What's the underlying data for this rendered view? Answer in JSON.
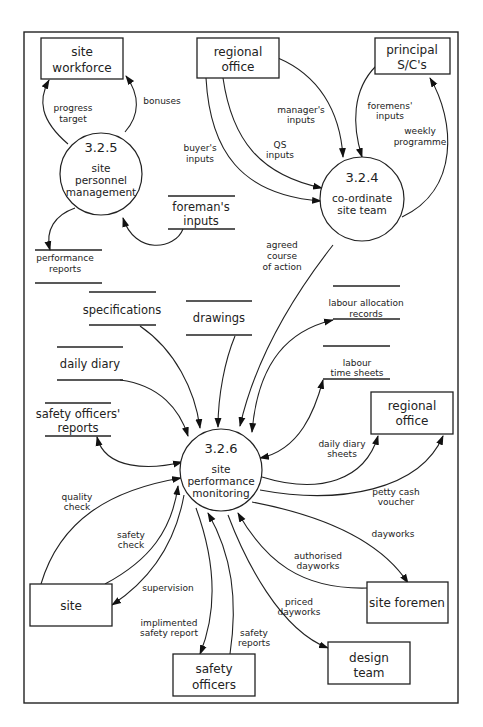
{
  "diagram": {
    "type": "data-flow-diagram",
    "processes": [
      {
        "id": "3.2.5",
        "name_lines": [
          "site",
          "personnel",
          "management"
        ]
      },
      {
        "id": "3.2.4",
        "name_lines": [
          "co-ordinate",
          "site team"
        ]
      },
      {
        "id": "3.2.6",
        "name_lines": [
          "site",
          "performance",
          "monitoring"
        ]
      }
    ],
    "entities": [
      {
        "key": "site_workforce",
        "lines": [
          "site",
          "workforce"
        ]
      },
      {
        "key": "regional_office_top",
        "lines": [
          "regional",
          "office"
        ]
      },
      {
        "key": "principal_sc",
        "lines": [
          "principal",
          "S/C's"
        ]
      },
      {
        "key": "regional_office_right",
        "lines": [
          "regional",
          "office"
        ]
      },
      {
        "key": "site",
        "lines": [
          "site"
        ]
      },
      {
        "key": "site_foremen",
        "lines": [
          "site foremen"
        ]
      },
      {
        "key": "safety_officers",
        "lines": [
          "safety",
          "officers"
        ]
      },
      {
        "key": "design_team",
        "lines": [
          "design",
          "team"
        ]
      }
    ],
    "stores": [
      {
        "key": "foremans_inputs",
        "lines": [
          "foreman's",
          "inputs"
        ]
      },
      {
        "key": "performance_reports",
        "lines": [
          "performance",
          "reports"
        ]
      },
      {
        "key": "specifications",
        "lines": [
          "specifications"
        ]
      },
      {
        "key": "drawings",
        "lines": [
          "drawings"
        ]
      },
      {
        "key": "daily_diary",
        "lines": [
          "daily diary"
        ]
      },
      {
        "key": "safety_officers_reports",
        "lines": [
          "safety officers'",
          "reports"
        ]
      },
      {
        "key": "labour_allocation_records",
        "lines": [
          "labour allocation",
          "records"
        ]
      },
      {
        "key": "labour_time_sheets",
        "lines": [
          "labour",
          "time sheets"
        ]
      }
    ],
    "flows": [
      {
        "key": "progress_target",
        "lines": [
          "progress",
          "target"
        ]
      },
      {
        "key": "bonuses",
        "lines": [
          "bonuses"
        ]
      },
      {
        "key": "buyers_inputs",
        "lines": [
          "buyer's",
          "inputs"
        ]
      },
      {
        "key": "managers_inputs",
        "lines": [
          "manager's",
          "inputs"
        ]
      },
      {
        "key": "qs_inputs",
        "lines": [
          "QS",
          "inputs"
        ]
      },
      {
        "key": "foremens_inputs",
        "lines": [
          "foremens'",
          "inputs"
        ]
      },
      {
        "key": "weekly_programme",
        "lines": [
          "weekly",
          "programme"
        ]
      },
      {
        "key": "agreed_course",
        "lines": [
          "agreed",
          "course",
          "of action"
        ]
      },
      {
        "key": "daily_diary_sheets",
        "lines": [
          "daily diary",
          "sheets"
        ]
      },
      {
        "key": "petty_cash_voucher",
        "lines": [
          "petty cash",
          "voucher"
        ]
      },
      {
        "key": "quality_check",
        "lines": [
          "quality",
          "check"
        ]
      },
      {
        "key": "safety_check",
        "lines": [
          "safety",
          "check"
        ]
      },
      {
        "key": "supervision",
        "lines": [
          "supervision"
        ]
      },
      {
        "key": "dayworks",
        "lines": [
          "dayworks"
        ]
      },
      {
        "key": "authorised_dayworks",
        "lines": [
          "authorised",
          "dayworks"
        ]
      },
      {
        "key": "priced_dayworks",
        "lines": [
          "priced",
          "dayworks"
        ]
      },
      {
        "key": "implimented_safety_report",
        "lines": [
          "implimented",
          "safety report"
        ]
      },
      {
        "key": "safety_reports",
        "lines": [
          "safety",
          "reports"
        ]
      }
    ]
  }
}
